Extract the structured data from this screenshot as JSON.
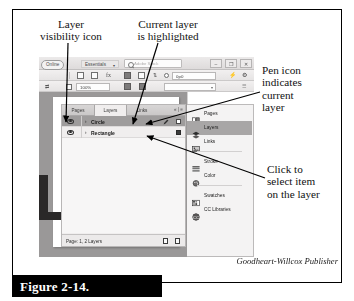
{
  "figure": {
    "caption": "Figure 2-14.",
    "credit": "Goodheart-Willcox Publisher"
  },
  "callouts": [
    {
      "id": "layer-visibility",
      "text": "Layer\nvisibility icon"
    },
    {
      "id": "current-layer-highlighted",
      "text": "Current layer\nis highlighted"
    },
    {
      "id": "pen-icon",
      "text": "Pen icon\nindicates\ncurrent\nlayer"
    },
    {
      "id": "click-to-select",
      "text": "Click to\nselect item\non the layer"
    }
  ],
  "app": {
    "appbar": {
      "online_pill": "Online",
      "workspace": "Essentials",
      "workspace_caret": "▾",
      "search_placeholder": "Adobe Stock",
      "window_buttons": [
        "–",
        "❐",
        "✕"
      ]
    },
    "control_bar": {
      "row1_field": "0p0",
      "row2_field": "100%",
      "row2_dropdown": "▾"
    },
    "panel": {
      "tabs": [
        {
          "label": "Pages",
          "active": false
        },
        {
          "label": "Layers",
          "active": true
        },
        {
          "label": "Links",
          "active": false
        }
      ],
      "tab_controls": "« | ≡",
      "layers": [
        {
          "name": "Circle",
          "selected": true,
          "visible": true,
          "twisty": "›",
          "has_pen": true,
          "box_dark": false
        },
        {
          "name": "Rectangle",
          "selected": false,
          "visible": true,
          "twisty": "›",
          "has_pen": false,
          "box_dark": true
        }
      ],
      "status": "Page: 1, 2 Layers"
    },
    "dock": [
      {
        "label": "Pages",
        "icon": "pages-icon",
        "selected": false
      },
      {
        "label": "Layers",
        "icon": "layers-icon",
        "selected": true
      },
      {
        "label": "Links",
        "icon": "links-icon",
        "selected": false
      },
      {
        "label": "Stroke",
        "icon": "stroke-icon",
        "selected": false
      },
      {
        "label": "Color",
        "icon": "color-icon",
        "selected": false
      },
      {
        "label": "Swatches",
        "icon": "swatches-icon",
        "selected": false
      },
      {
        "label": "CC Libraries",
        "icon": "cc-libraries-icon",
        "selected": false
      }
    ]
  },
  "colors": {
    "selection_gray": "#9e9c9c",
    "dock_selection_gray": "#a8a6a6",
    "frame_black": "#000000"
  }
}
